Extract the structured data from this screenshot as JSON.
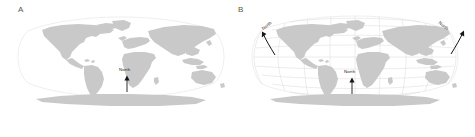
{
  "figure": {
    "background_color": "#ffffff",
    "land_color": "#c9c9c9",
    "graticule_color": "#d9d9d9",
    "outline_color": "#e2e2e2",
    "arrow_color": "#151515",
    "label_color": "#1a1a1a"
  },
  "panels": [
    {
      "id": "A",
      "label": "A",
      "projection": "Robinson",
      "graticule_visible": false,
      "arrows": [
        {
          "id": "center",
          "label": "North",
          "direction": "up",
          "angle_deg": 0,
          "tip_x": 127,
          "tip_y": 76,
          "tail_x": 127,
          "tail_y": 92,
          "label_x": 119,
          "label_y": 70
        }
      ]
    },
    {
      "id": "B",
      "label": "B",
      "projection": "Robinson",
      "graticule_visible": true,
      "graticule": {
        "meridian_step_deg": 20,
        "parallel_step_deg": 20,
        "lon_range": [
          -180,
          180
        ],
        "lat_range": [
          -90,
          90
        ]
      },
      "arrows": [
        {
          "id": "left",
          "label": "North",
          "direction": "up-left",
          "angle_deg": -38,
          "tip_x": 262,
          "tip_y": 32,
          "tail_x": 275,
          "tail_y": 55,
          "label_x": 266,
          "label_y": 31
        },
        {
          "id": "center",
          "label": "North",
          "direction": "up",
          "angle_deg": 0,
          "tip_x": 352,
          "tip_y": 78,
          "tail_x": 352,
          "tail_y": 94,
          "label_x": 344,
          "label_y": 72
        },
        {
          "id": "right",
          "label": "North",
          "direction": "up-right",
          "angle_deg": 38,
          "tip_x": 464,
          "tip_y": 31,
          "tail_x": 451,
          "tail_y": 54,
          "label_x": 437,
          "label_y": 31
        }
      ]
    }
  ]
}
